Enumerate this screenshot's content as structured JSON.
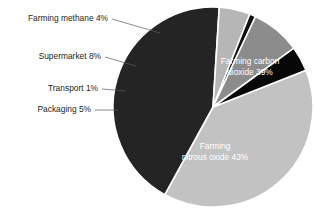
{
  "chart_data": {
    "type": "pie",
    "title": "",
    "labels": [
      "Farming carbon dioxide",
      "Farming nitrous oxide",
      "Packaging",
      "Transport",
      "Supermarket",
      "Farming methane"
    ],
    "values": [
      39,
      43,
      5,
      1,
      8,
      4
    ],
    "unit": "%",
    "total": 100,
    "legend": "none",
    "grid": false,
    "colors": [
      "#c2c2c2",
      "#242424",
      "#b6b6b6",
      "#121212",
      "#8c8c8c",
      "#070707"
    ],
    "background": "#ffffff",
    "slices": [
      {
        "label": "Farming carbon dioxide",
        "value": 39,
        "color": "#c2c2c2",
        "label_text": "Farming carbon\ndioxide 39%",
        "label_placement": "inside",
        "label_color": "#ffffff"
      },
      {
        "label": "Farming nitrous oxide",
        "value": 43,
        "color": "#242424",
        "label_text": "Farming\nnitrous oxide 43%",
        "label_placement": "inside",
        "label_color": "#ffffff"
      },
      {
        "label": "Packaging",
        "value": 5,
        "color": "#b6b6b6",
        "label_text": "Packaging 5%",
        "label_placement": "outside-left",
        "label_color": "#231f20"
      },
      {
        "label": "Transport",
        "value": 1,
        "color": "#121212",
        "label_text": "Transport 1%",
        "label_placement": "outside-left",
        "label_color": "#231f20"
      },
      {
        "label": "Supermarket",
        "value": 8,
        "color": "#8c8c8c",
        "label_text": "Supermarket 8%",
        "label_placement": "outside-left",
        "label_color": "#231f20"
      },
      {
        "label": "Farming methane",
        "value": 4,
        "color": "#070707",
        "label_text": "Farming methane 4%",
        "label_placement": "outside-left",
        "label_color": "#231f20"
      }
    ]
  },
  "callouts": {
    "methane": "Farming methane 4%",
    "supermarket": "Supermarket 8%",
    "transport": "Transport 1%",
    "packaging": "Packaging 5%"
  },
  "inner_labels": {
    "carbon_line1": "Farming carbon",
    "carbon_line2": "dioxide 39%",
    "nitrous_line1": "Farming",
    "nitrous_line2": "nitrous oxide 43%"
  }
}
